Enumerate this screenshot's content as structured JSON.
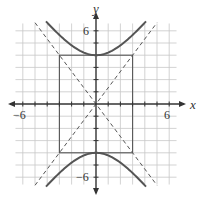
{
  "chart_data": {
    "type": "line",
    "title": "",
    "equation": "y^2/16 - x^2/9 = 1",
    "xlabel": "x",
    "ylabel": "y",
    "xlim": [
      -6.5,
      6.5
    ],
    "ylim": [
      -6.5,
      6.5
    ],
    "grid": true,
    "tick_labels": {
      "x": [
        "-6",
        "6"
      ],
      "y": [
        "6",
        "-6"
      ]
    },
    "curves": [
      {
        "name": "hyperbola-upper-branch",
        "style": "solid",
        "vertex": [
          0,
          4
        ]
      },
      {
        "name": "hyperbola-lower-branch",
        "style": "solid",
        "vertex": [
          0,
          -4
        ]
      }
    ],
    "asymptotes": [
      {
        "equation": "y = 4/3 x",
        "style": "dashed"
      },
      {
        "equation": "y = -4/3 x",
        "style": "dashed"
      }
    ],
    "central_rectangle": {
      "x": [
        -3,
        3
      ],
      "y": [
        -4,
        4
      ],
      "style": "solid"
    }
  },
  "labels": {
    "x_axis": "x",
    "y_axis": "y",
    "x_min": "−6",
    "x_max": "6",
    "y_max": "6",
    "y_min": "−6"
  },
  "colors": {
    "grid": "#c8c8c8",
    "axis": "#333333",
    "curve": "#555555"
  }
}
